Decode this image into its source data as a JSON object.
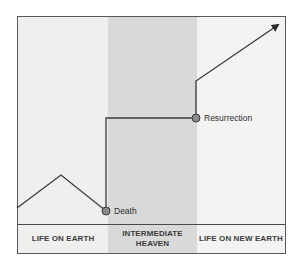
{
  "diagram": {
    "columns": [
      {
        "id": "earth",
        "label": "LIFE ON EARTH"
      },
      {
        "id": "heaven",
        "label": "INTERMEDIATE\nHEAVEN"
      },
      {
        "id": "new-earth",
        "label": "LIFE ON NEW EARTH"
      }
    ],
    "points": {
      "death": "Death",
      "resurrection": "Resurrection"
    },
    "colors": {
      "line": "#3a3a3a",
      "dot_fill": "#8a8a8a",
      "dot_stroke": "#3a3a3a",
      "heaven_band": "#d9d9d9",
      "earth_band": "#efefee",
      "new_earth_band": "#f3f3f2"
    },
    "path": [
      [
        17,
        208
      ],
      [
        61,
        175
      ],
      [
        106,
        211
      ],
      [
        106,
        118
      ],
      [
        196,
        118
      ],
      [
        196,
        81
      ],
      [
        278,
        25
      ]
    ]
  }
}
